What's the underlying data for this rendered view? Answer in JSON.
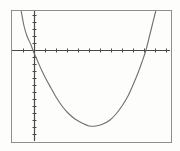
{
  "figure": {
    "name": "graphing-calculator-parabola",
    "background_color": "#fdfdfc",
    "frame": {
      "x": 11,
      "y": 10,
      "width": 160,
      "height": 132,
      "stroke_color": "#8e8e8e",
      "stroke_width": 1
    }
  },
  "chart_data": {
    "type": "line",
    "title": "",
    "subtitle": "",
    "xlabel": "",
    "ylabel": "",
    "grid": false,
    "legend": "none",
    "axis_style": "calculator-screen",
    "annotations": [],
    "tick_labels": {
      "x": [],
      "y": []
    },
    "axes": {
      "x_axis": {
        "name": "x-axis",
        "pixel_y": 50,
        "pixel_x_start": 12,
        "pixel_x_end": 170,
        "tick_count": 15,
        "tick_spacing_px": 11,
        "tick_length_px": 4,
        "stroke_color": "#4a4a4a",
        "stroke_width": 1.2
      },
      "y_axis": {
        "name": "y-axis",
        "pixel_x": 34,
        "pixel_y_start": 11,
        "pixel_y_end": 141,
        "tick_count": 18,
        "tick_spacing_px": 7,
        "tick_length_px": 4,
        "stroke_color": "#4a4a4a",
        "stroke_width": 1.2
      }
    },
    "origin_px": {
      "x": 34,
      "y": 50
    },
    "xlim": [
      -2.1,
      12.3
    ],
    "ylim": [
      -13.1,
      3.9
    ],
    "series": [
      {
        "name": "parabola",
        "kind": "quadratic",
        "color": "#6f6f6f",
        "stroke_width": 1.1,
        "vertex": {
          "x": 5.35,
          "y": -7.6
        },
        "x_intercepts": [
          -0.18,
          10.9
        ],
        "y_intercept": -0.4,
        "x": [
          -0.8,
          -0.4,
          0.0,
          0.6,
          1.2,
          1.8,
          2.4,
          3.0,
          3.6,
          4.2,
          4.8,
          5.4,
          6.0,
          6.6,
          7.2,
          7.8,
          8.4,
          9.0,
          9.6,
          10.2,
          10.8,
          11.4,
          12.0
        ],
        "y": [
          3.9,
          1.4,
          -0.4,
          -2.6,
          -4.3,
          -5.6,
          -6.5,
          -7.1,
          -7.5,
          -7.6,
          -7.6,
          -7.6,
          -7.4,
          -7.0,
          -6.4,
          -5.6,
          -4.6,
          -3.4,
          -2.0,
          -0.4,
          1.4,
          3.4,
          5.6
        ],
        "pixel_points": [
          {
            "x": 21,
            "y": 10
          },
          {
            "x": 24,
            "y": 26
          },
          {
            "x": 27,
            "y": 36
          },
          {
            "x": 31,
            "y": 45
          },
          {
            "x": 34,
            "y": 53
          },
          {
            "x": 38,
            "y": 62
          },
          {
            "x": 42,
            "y": 71
          },
          {
            "x": 46,
            "y": 79
          },
          {
            "x": 51,
            "y": 88
          },
          {
            "x": 56,
            "y": 97
          },
          {
            "x": 62,
            "y": 106
          },
          {
            "x": 68,
            "y": 113
          },
          {
            "x": 75,
            "y": 119
          },
          {
            "x": 82,
            "y": 123
          },
          {
            "x": 89,
            "y": 126
          },
          {
            "x": 96,
            "y": 126
          },
          {
            "x": 103,
            "y": 124
          },
          {
            "x": 110,
            "y": 120
          },
          {
            "x": 116,
            "y": 114
          },
          {
            "x": 122,
            "y": 106
          },
          {
            "x": 128,
            "y": 96
          },
          {
            "x": 133,
            "y": 85
          },
          {
            "x": 138,
            "y": 73
          },
          {
            "x": 142,
            "y": 62
          },
          {
            "x": 146,
            "y": 50
          },
          {
            "x": 149,
            "y": 38
          },
          {
            "x": 152,
            "y": 26
          },
          {
            "x": 155,
            "y": 14
          },
          {
            "x": 156,
            "y": 10
          }
        ]
      }
    ]
  }
}
